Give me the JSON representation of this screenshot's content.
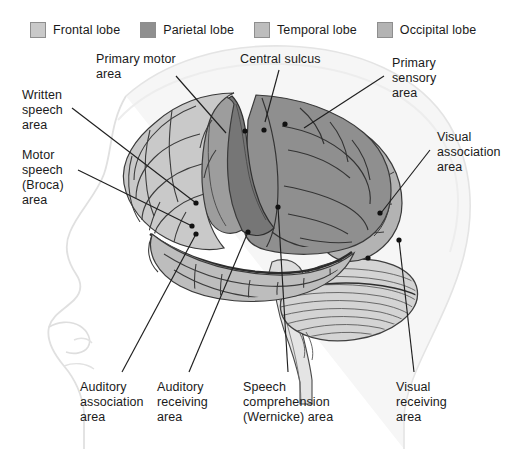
{
  "figure": {
    "width": 521,
    "height": 449
  },
  "legend": {
    "items": [
      {
        "label": "Frontal lobe",
        "color": "#c9c9c9",
        "icon": "color-swatch-icon"
      },
      {
        "label": "Parietal lobe",
        "color": "#8f8f8f",
        "icon": "color-swatch-icon"
      },
      {
        "label": "Temporal lobe",
        "color": "#bdbdbd",
        "icon": "color-swatch-icon"
      },
      {
        "label": "Occipital lobe",
        "color": "#b3b3b3",
        "icon": "color-swatch-icon"
      }
    ]
  },
  "labels": {
    "primary_motor_area": "Primary motor\narea",
    "central_sulcus": "Central sulcus",
    "primary_sensory_area": "Primary\nsensory\narea",
    "written_speech_area": "Written\nspeech\narea",
    "motor_speech_broca_area": "Motor\nspeech\n(Broca)\narea",
    "visual_association_area": "Visual\nassociation\narea",
    "auditory_association_area": "Auditory\nassociation\narea",
    "auditory_receiving_area": "Auditory\nreceiving\narea",
    "speech_comprehension_wernicke_area": "Speech\ncomprehension\n(Wernicke) area",
    "visual_receiving_area": "Visual\nreceiving\narea"
  },
  "colors": {
    "frontal_lobe": "#c9c9c9",
    "parietal_lobe": "#8f8f8f",
    "temporal_lobe": "#bdbdbd",
    "occipital_lobe": "#b3b3b3",
    "primary_motor_strip": "#9d9d9d",
    "central_sulcus_band": "#767676",
    "cerebellum": "#d3d3d3",
    "brainstem": "#e2e2e2",
    "head_outline": "#f2f2f2",
    "sulci_line": "#3c3c3c",
    "leader_line": "#1f1f1f",
    "background": "#ffffff"
  },
  "annotations": {
    "leader_dot_count": 11,
    "view": "left lateral"
  }
}
